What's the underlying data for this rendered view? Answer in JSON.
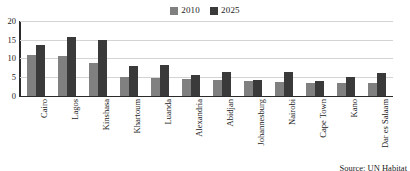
{
  "chart_data": {
    "type": "bar",
    "title": "",
    "subtitle": "",
    "xlabel": "",
    "ylabel": "",
    "ylim": [
      0,
      20
    ],
    "yticks": [
      20,
      15,
      10,
      5,
      0
    ],
    "grid": true,
    "legend_position": "top-center",
    "categories": [
      "Cairo",
      "Lagos",
      "Kinshasa",
      "Khartoum",
      "Luanda",
      "Alexandria",
      "Abidjan",
      "Johannesburg",
      "Nairobi",
      "Cape Town",
      "Kano",
      "Dar es Salaam"
    ],
    "series": [
      {
        "name": "2010",
        "color": "#808080",
        "values": [
          10.9,
          10.5,
          8.7,
          5.1,
          4.8,
          4.4,
          4.2,
          3.8,
          3.6,
          3.4,
          3.4,
          3.4
        ]
      },
      {
        "name": "2025",
        "color": "#3a3a3a",
        "values": [
          13.5,
          15.8,
          14.9,
          7.9,
          8.1,
          5.6,
          6.3,
          4.2,
          6.2,
          3.9,
          5.0,
          6.1
        ]
      }
    ],
    "annotations": [
      {
        "name": "source-note",
        "text": "Source: UN Habitat"
      }
    ]
  },
  "legend": {
    "entries": [
      {
        "label": "2010",
        "color": "#808080"
      },
      {
        "label": "2025",
        "color": "#3a3a3a"
      }
    ]
  },
  "source": {
    "text": "Source: UN Habitat"
  }
}
